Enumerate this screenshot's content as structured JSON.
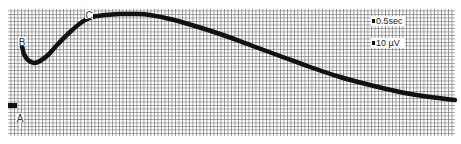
{
  "chart_data": {
    "type": "line",
    "title": "",
    "xlabel": "",
    "ylabel": "",
    "grid": true,
    "background": "#ffffff",
    "grid_color": "#555555",
    "line_color": "#111111",
    "plot_area": {
      "x0": 8,
      "y0": 9,
      "x1": 455,
      "y1": 136
    },
    "series": [
      {
        "name": "waveform",
        "points": [
          [
            22,
            46
          ],
          [
            24,
            54
          ],
          [
            28,
            60
          ],
          [
            34,
            63
          ],
          [
            40,
            61
          ],
          [
            48,
            55
          ],
          [
            58,
            44
          ],
          [
            70,
            32
          ],
          [
            82,
            22
          ],
          [
            92,
            17
          ],
          [
            105,
            15
          ],
          [
            120,
            14
          ],
          [
            135,
            14
          ],
          [
            150,
            15
          ],
          [
            170,
            19
          ],
          [
            195,
            26
          ],
          [
            220,
            34
          ],
          [
            250,
            45
          ],
          [
            280,
            56
          ],
          [
            310,
            67
          ],
          [
            340,
            77
          ],
          [
            370,
            85
          ],
          [
            400,
            92
          ],
          [
            430,
            97
          ],
          [
            455,
            100
          ]
        ]
      }
    ],
    "annotations": [
      {
        "label": "B",
        "x": 22,
        "y": 42
      },
      {
        "label": "C",
        "x": 89,
        "y": 15
      },
      {
        "label": "A",
        "x": 20,
        "y": 118
      }
    ],
    "scale_markers": [
      {
        "label": "0.5sec",
        "x": 372,
        "y": 21
      },
      {
        "label": "10 µV",
        "x": 372,
        "y": 43
      }
    ],
    "baseline_marker": {
      "x": 8,
      "y": 103,
      "w": 9,
      "h": 5
    }
  }
}
